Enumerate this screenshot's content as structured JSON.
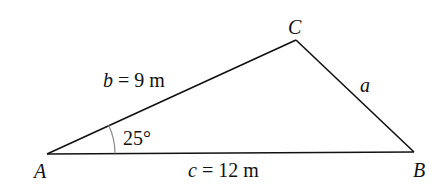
{
  "diagram": {
    "type": "triangle",
    "vertices": {
      "A": {
        "label": "A",
        "x": 47,
        "y": 154
      },
      "B": {
        "label": "B",
        "x": 414,
        "y": 152
      },
      "C": {
        "label": "C",
        "x": 296,
        "y": 40
      }
    },
    "sides": {
      "b": {
        "var": "b",
        "eq": " = 9 m",
        "between": "A-C"
      },
      "a": {
        "var": "a",
        "between": "C-B"
      },
      "c": {
        "var": "c",
        "eq": " = 12 m",
        "between": "A-B"
      }
    },
    "angle_A": {
      "label": "25°",
      "value_deg": 25
    },
    "colors": {
      "line": "#111111",
      "arc": "#8a8a8a",
      "background": "#ffffff"
    }
  }
}
